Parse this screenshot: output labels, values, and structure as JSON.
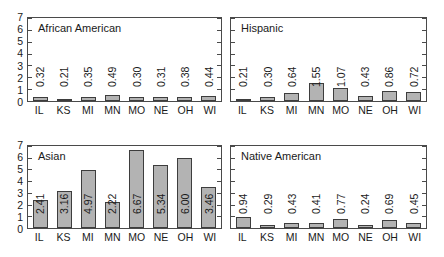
{
  "chart_data": {
    "type": "bar",
    "title": "",
    "layout": {
      "rows": 2,
      "cols": 2,
      "grid": false,
      "legend": "none"
    },
    "categories": [
      "IL",
      "KS",
      "MI",
      "MN",
      "MO",
      "NE",
      "OH",
      "WI"
    ],
    "xlabel": "",
    "ylabel": "",
    "ylim": [
      0,
      7
    ],
    "yticks": [
      0,
      1,
      2,
      3,
      4,
      5,
      6,
      7
    ],
    "ytick_labels_shown_on": "left column only",
    "bar_fill_color": "#b3b3b3",
    "bar_edge_color": "#3d3d3d",
    "value_label_rotation": -90,
    "panels": [
      {
        "title": "African American",
        "position": "top-left",
        "y_axis_labeled": true,
        "values": [
          0.32,
          0.21,
          0.35,
          0.49,
          0.3,
          0.31,
          0.38,
          0.44
        ],
        "value_labels": [
          "0.32",
          "0.21",
          "0.35",
          "0.49",
          "0.30",
          "0.31",
          "0.38",
          "0.44"
        ]
      },
      {
        "title": "Hispanic",
        "position": "top-right",
        "y_axis_labeled": false,
        "values": [
          0.21,
          0.3,
          0.64,
          1.55,
          1.07,
          0.43,
          0.86,
          0.72
        ],
        "value_labels": [
          "0.21",
          "0.30",
          "0.64",
          "1.55",
          "1.07",
          "0.43",
          "0.86",
          "0.72"
        ]
      },
      {
        "title": "Asian",
        "position": "bottom-left",
        "y_axis_labeled": true,
        "values": [
          2.41,
          3.16,
          4.97,
          2.22,
          6.67,
          5.34,
          6.0,
          3.46
        ],
        "value_labels": [
          "2.41",
          "3.16",
          "4.97",
          "2.22",
          "6.67",
          "5.34",
          "6.00",
          "3.46"
        ]
      },
      {
        "title": "Native American",
        "position": "bottom-right",
        "y_axis_labeled": false,
        "values": [
          0.94,
          0.29,
          0.43,
          0.41,
          0.77,
          0.24,
          0.69,
          0.45
        ],
        "value_labels": [
          "0.94",
          "0.29",
          "0.43",
          "0.41",
          "0.77",
          "0.24",
          "0.69",
          "0.45"
        ]
      }
    ]
  }
}
